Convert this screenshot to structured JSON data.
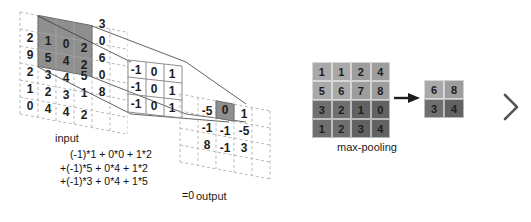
{
  "diagram": {
    "colors": {
      "highlight_fill": "#8f8f8f",
      "highlight_stroke": "#6e6e6e",
      "grid_dash": "#b9b9b9",
      "text": "#1d1d1b",
      "pool_quad_top_left": "#a9a9a9",
      "pool_quad_top_right": "#9d9d9d",
      "pool_quad_bottom_left": "#6f6f6f",
      "pool_quad_bottom_right": "#626262"
    }
  },
  "input": {
    "label": "input",
    "rows": [
      [
        "",
        "",
        "",
        "",
        "3",
        ""
      ],
      [
        "2",
        "1",
        "0",
        "2",
        "0",
        ""
      ],
      [
        "9",
        "5",
        "4",
        "2",
        "6",
        ""
      ],
      [
        "2",
        "3",
        "4",
        "5",
        "0",
        ""
      ],
      [
        "1",
        "2",
        "3",
        "1",
        "8",
        ""
      ],
      [
        "0",
        "4",
        "4",
        "2",
        "",
        ""
      ]
    ],
    "receptive_field": {
      "values": [
        [
          "1",
          "0",
          "2"
        ],
        [
          "5",
          "4",
          "2"
        ],
        [
          "3",
          "4",
          "5"
        ]
      ],
      "row_start": 1,
      "col_start": 1,
      "size": 3
    }
  },
  "kernel": {
    "label": "kernel",
    "rows": [
      [
        "-1",
        "0",
        "1"
      ],
      [
        "-1",
        "0",
        "1"
      ],
      [
        "-1",
        "0",
        "1"
      ]
    ]
  },
  "output": {
    "label": "output",
    "rows": [
      [
        "-5",
        "0",
        "1"
      ],
      [
        "-1",
        "-1",
        "-5"
      ],
      [
        "8",
        "-1",
        "3"
      ]
    ],
    "highlighted_cell": {
      "row": 0,
      "col": 1,
      "value": "0"
    }
  },
  "equation": {
    "lines": [
      "(-1)*1 + 0*0 + 1*2",
      "+(-1)*5 + 0*4 + 1*2",
      "+(-1)*3 + 0*4 + 1*5"
    ],
    "result": "=0"
  },
  "maxpool": {
    "label": "max-pooling",
    "source_rows": [
      [
        "1",
        "1",
        "2",
        "4"
      ],
      [
        "5",
        "6",
        "7",
        "8"
      ],
      [
        "3",
        "2",
        "1",
        "0"
      ],
      [
        "1",
        "2",
        "3",
        "4"
      ]
    ],
    "result_rows": [
      [
        "6",
        "8"
      ],
      [
        "3",
        "4"
      ]
    ],
    "arrow": "right-arrow-icon"
  },
  "next_indicator": "chevron-right-icon"
}
